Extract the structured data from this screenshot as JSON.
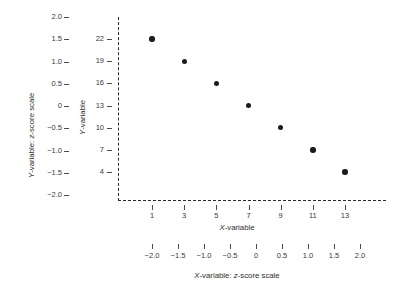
{
  "chart_data": {
    "type": "scatter",
    "title": "",
    "xlabel": "X-variable",
    "ylabel": "Y-variable",
    "x": [
      1,
      3,
      5,
      7,
      9,
      11,
      13
    ],
    "values": [
      22,
      19,
      16,
      13,
      10,
      7,
      4
    ],
    "points": [
      {
        "x": 1,
        "y": 22
      },
      {
        "x": 3,
        "y": 19
      },
      {
        "x": 5,
        "y": 16
      },
      {
        "x": 7,
        "y": 13
      },
      {
        "x": 9,
        "y": 10
      },
      {
        "x": 11,
        "y": 7
      },
      {
        "x": 13,
        "y": 4
      }
    ],
    "grid": false,
    "legend": "none",
    "marker_color": "#1c1c1c",
    "axis_color": "#2b2b2b",
    "axes": {
      "y_primary": {
        "label": "Y-variable",
        "ticks": [
          "22",
          "19",
          "16",
          "13",
          "10",
          "7",
          "4"
        ],
        "values": [
          22,
          19,
          16,
          13,
          10,
          7,
          4
        ]
      },
      "y_secondary": {
        "label": "Y-variable: z-score scale",
        "ticks": [
          "2.0",
          "1.5",
          "1.0",
          "0.5",
          "0",
          "-0.5",
          "-1.0",
          "-1.5",
          "-2.0"
        ],
        "tick_display": [
          "2.0",
          "1.5",
          "1.0",
          "0.5",
          "0",
          "−0.5",
          "−1.0",
          "−1.5",
          "−2.0"
        ],
        "values": [
          2.0,
          1.5,
          1.0,
          0.5,
          0,
          -0.5,
          -1.0,
          -1.5,
          -2.0
        ],
        "ylim": [
          -2.0,
          2.0
        ]
      },
      "x_primary": {
        "label": "X-variable",
        "ticks": [
          "1",
          "3",
          "5",
          "7",
          "9",
          "11",
          "13"
        ],
        "values": [
          1,
          3,
          5,
          7,
          9,
          11,
          13
        ]
      },
      "x_secondary": {
        "label": "X-variable: z-score scale",
        "ticks": [
          "-2.0",
          "-1.5",
          "-1.0",
          "-0.5",
          "0",
          "0.5",
          "1.0",
          "1.5",
          "2.0"
        ],
        "tick_display": [
          "−2.0",
          "−1.5",
          "−1.0",
          "−0.5",
          "0",
          "0.5",
          "1.0",
          "1.5",
          "2.0"
        ],
        "values": [
          -2.0,
          -1.5,
          -1.0,
          -0.5,
          0,
          0.5,
          1.0,
          1.5,
          2.0
        ],
        "xlim": [
          -2.0,
          2.0
        ]
      }
    }
  },
  "titles": {
    "y_zscore": "Y-variable: z-score scale",
    "y_raw": "Y-variable",
    "x_raw": "X-variable",
    "x_zscore": "X-variable: z-score scale",
    "x_italic": "X",
    "y_italic": "Y",
    "z_italic": "z"
  }
}
